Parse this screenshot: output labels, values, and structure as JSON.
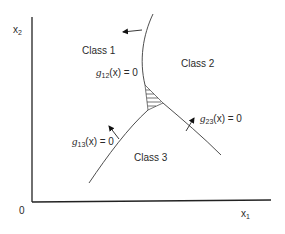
{
  "diagram": {
    "type": "decision-boundaries",
    "axes": {
      "x_label": "x",
      "x_sub": "1",
      "y_label": "x",
      "y_sub": "2",
      "origin_label": "0"
    },
    "regions": [
      {
        "label": "Class 1"
      },
      {
        "label": "Class 2"
      },
      {
        "label": "Class 3"
      }
    ],
    "boundaries": [
      {
        "func": "g",
        "sub": "12",
        "arg": "(x) = 0"
      },
      {
        "func": "g",
        "sub": "13",
        "arg": "(x) = 0"
      },
      {
        "func": "g",
        "sub": "23",
        "arg": "(x) = 0"
      }
    ],
    "colors": {
      "line": "#3a3a3a",
      "axis": "#222222",
      "text": "#2a2a2a"
    }
  }
}
